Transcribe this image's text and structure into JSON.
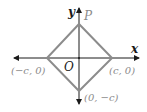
{
  "diagram": {
    "type": "coordinate-diagram",
    "axes": {
      "x_label": "x",
      "y_label": "y",
      "origin_label": "O"
    },
    "shape": "square (rotated 45°)",
    "vertices": [
      {
        "name": "top",
        "label": "P"
      },
      {
        "name": "right",
        "label": "(c, 0)"
      },
      {
        "name": "bottom",
        "label": "(0, −c)"
      },
      {
        "name": "left",
        "label": "(−c, 0)"
      }
    ],
    "colors": {
      "axes": "#1a1a1a",
      "shape": "#8c8c8c",
      "vertex_labels": "#8c8c8c"
    }
  }
}
